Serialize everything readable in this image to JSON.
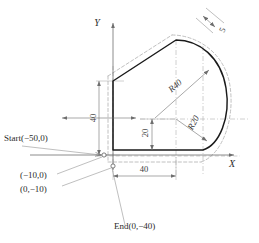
{
  "drawing": {
    "title": "CNC contour tool-path layout with cutter offset",
    "axes": {
      "x_label": "X",
      "y_label": "Y"
    },
    "points": [
      {
        "name": "start-point",
        "label": "Start(−50,0)"
      },
      {
        "name": "point-neg10-0",
        "label": "(−10,0)"
      },
      {
        "name": "point-0-neg10",
        "label": "(0,−10)"
      },
      {
        "name": "end-point",
        "label": "End(0,−40)"
      }
    ],
    "dimensions": [
      {
        "name": "height-40",
        "label": "40",
        "orientation": "vertical"
      },
      {
        "name": "height-20",
        "label": "20",
        "orientation": "vertical"
      },
      {
        "name": "width-40",
        "label": "40",
        "orientation": "horizontal"
      },
      {
        "name": "offset-5",
        "label": "5",
        "orientation": "rotated"
      }
    ],
    "radii": [
      {
        "name": "radius-r40",
        "label": "R40"
      },
      {
        "name": "radius-r20",
        "label": "R20"
      }
    ],
    "colors": {
      "profile": "#1a1a1a",
      "offset_path": "#b0b0b0",
      "construction": "#9a9a9a",
      "dimension": "#6e6e6e",
      "text": "#2b2b2b",
      "background": "#ffffff"
    }
  }
}
